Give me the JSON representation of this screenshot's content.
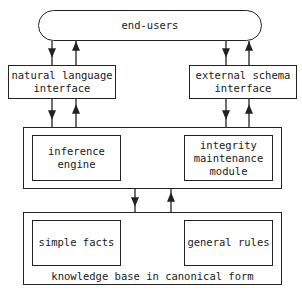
{
  "diagram": {
    "top": {
      "label": "end-users"
    },
    "interfaces": [
      {
        "label": "natural language\ninterface"
      },
      {
        "label": "external schema\ninterface"
      }
    ],
    "processing": {
      "components": [
        {
          "label": "inference\nengine"
        },
        {
          "label": "integrity\nmaintenance\nmodule"
        }
      ]
    },
    "knowledge_base": {
      "caption": "knowledge base in canonical form",
      "components": [
        {
          "label": "simple facts"
        },
        {
          "label": "general rules"
        }
      ]
    },
    "connections": [
      {
        "from": "end-users",
        "to": "natural language interface",
        "bidirectional": true
      },
      {
        "from": "end-users",
        "to": "external schema interface",
        "bidirectional": true
      },
      {
        "from": "natural language interface",
        "to": "processing layer",
        "bidirectional": true
      },
      {
        "from": "external schema interface",
        "to": "processing layer",
        "bidirectional": true
      },
      {
        "from": "processing layer",
        "to": "knowledge base in canonical form",
        "bidirectional": true
      }
    ]
  }
}
